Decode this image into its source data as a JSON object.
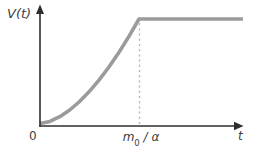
{
  "figure": {
    "ylabel": "V(t)",
    "xlabel": "t",
    "origin_label": "0",
    "x_tick": {
      "base": "m",
      "sub": "0",
      "rest": " / α"
    }
  },
  "colors": {
    "background": "#ffffff",
    "axis": "#2e2e2e",
    "curve": "#9b9b9b",
    "dashed": "#b4b4b4",
    "text": "#3c3c3c"
  },
  "chart_data": {
    "type": "line",
    "title": "",
    "xlabel": "t",
    "ylabel": "V(t)",
    "xlim": [
      0,
      2.05
    ],
    "ylim": [
      0,
      1.2
    ],
    "grid": false,
    "legend": false,
    "x_ticks": [
      {
        "x": 0,
        "label": "0"
      },
      {
        "x": 1,
        "label": "m₀ / α"
      }
    ],
    "series": [
      {
        "name": "V(t)",
        "color": "#9b9b9b",
        "points": [
          [
            0,
            0
          ],
          [
            0.1,
            0.02
          ],
          [
            0.2,
            0.065
          ],
          [
            0.3,
            0.129
          ],
          [
            0.4,
            0.211
          ],
          [
            0.5,
            0.308
          ],
          [
            0.6,
            0.42
          ],
          [
            0.7,
            0.545
          ],
          [
            0.8,
            0.684
          ],
          [
            0.9,
            0.836
          ],
          [
            1,
            1
          ],
          [
            2.05,
            1
          ]
        ]
      }
    ],
    "annotations": [
      {
        "type": "dashed-vline",
        "x": 1,
        "y_from": 0,
        "y_to": 0.96,
        "label": "m₀ / α"
      }
    ]
  }
}
